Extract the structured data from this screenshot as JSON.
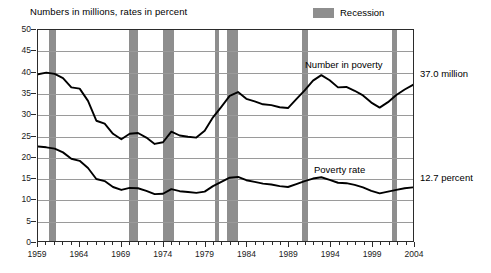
{
  "caption": "Numbers in millions, rates in percent",
  "legend": {
    "recession_label": "Recession",
    "recession_color": "#8e8e8e"
  },
  "annotations": {
    "number_label": "Number in poverty",
    "rate_label": "Poverty rate",
    "number_endpoint": "37.0 million",
    "rate_endpoint": "12.7 percent"
  },
  "axes": {
    "y_ticks": [
      "0",
      "5",
      "10",
      "15",
      "20",
      "25",
      "30",
      "35",
      "40",
      "45",
      "50"
    ],
    "x_ticks": [
      "1959",
      "1964",
      "1969",
      "1974",
      "1979",
      "1984",
      "1989",
      "1994",
      "1999",
      "2004"
    ]
  },
  "chart_data": {
    "type": "line",
    "title": "",
    "subtitle": "Numbers in millions, rates in percent",
    "xlabel": "",
    "ylabel": "",
    "ylim": [
      0,
      50
    ],
    "xlim": [
      1959,
      2004
    ],
    "grid": true,
    "legend_position": "top-right",
    "x": [
      1959,
      1960,
      1961,
      1962,
      1963,
      1964,
      1965,
      1966,
      1967,
      1968,
      1969,
      1970,
      1971,
      1972,
      1973,
      1974,
      1975,
      1976,
      1977,
      1978,
      1979,
      1980,
      1981,
      1982,
      1983,
      1984,
      1985,
      1986,
      1987,
      1988,
      1989,
      1990,
      1991,
      1992,
      1993,
      1994,
      1995,
      1996,
      1997,
      1998,
      1999,
      2000,
      2001,
      2002,
      2003,
      2004
    ],
    "series": [
      {
        "name": "Number in poverty",
        "units": "millions",
        "endpoint_label": "37.0 million",
        "values": [
          39.5,
          39.9,
          39.6,
          38.6,
          36.4,
          36.1,
          33.2,
          28.5,
          27.8,
          25.4,
          24.1,
          25.4,
          25.6,
          24.5,
          23.0,
          23.4,
          25.9,
          25.0,
          24.7,
          24.5,
          26.1,
          29.3,
          31.8,
          34.4,
          35.3,
          33.7,
          33.1,
          32.4,
          32.2,
          31.7,
          31.5,
          33.6,
          35.7,
          38.0,
          39.3,
          38.1,
          36.4,
          36.5,
          35.6,
          34.5,
          32.8,
          31.6,
          32.9,
          34.6,
          35.9,
          37.0
        ]
      },
      {
        "name": "Poverty rate",
        "units": "percent",
        "endpoint_label": "12.7 percent",
        "values": [
          22.4,
          22.2,
          21.9,
          21.0,
          19.5,
          19.0,
          17.3,
          14.7,
          14.2,
          12.8,
          12.1,
          12.6,
          12.5,
          11.9,
          11.1,
          11.2,
          12.3,
          11.8,
          11.6,
          11.4,
          11.7,
          13.0,
          14.0,
          15.0,
          15.2,
          14.4,
          14.0,
          13.6,
          13.4,
          13.0,
          12.8,
          13.5,
          14.2,
          14.8,
          15.1,
          14.5,
          13.8,
          13.7,
          13.3,
          12.7,
          11.9,
          11.3,
          11.7,
          12.1,
          12.5,
          12.7
        ]
      }
    ],
    "recession_bands": [
      {
        "start": 1960.3,
        "end": 1961.2
      },
      {
        "start": 1969.9,
        "end": 1970.9
      },
      {
        "start": 1973.9,
        "end": 1975.2
      },
      {
        "start": 1980.1,
        "end": 1980.6
      },
      {
        "start": 1981.5,
        "end": 1982.9
      },
      {
        "start": 1990.5,
        "end": 1991.2
      },
      {
        "start": 2001.2,
        "end": 2001.9
      }
    ]
  }
}
